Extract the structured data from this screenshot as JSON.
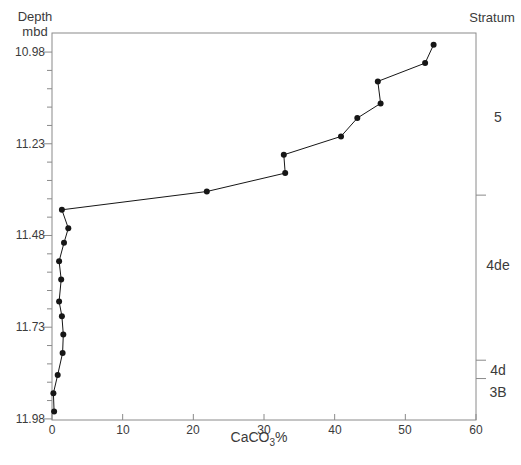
{
  "figure": {
    "y_axis_title_line1": "Depth",
    "y_axis_title_line2": "mbd",
    "right_axis_title": "Stratum",
    "x_axis_title_base": "CaCO",
    "x_axis_title_sub": "3",
    "x_axis_title_suffix": "%"
  },
  "chart_data": {
    "type": "line",
    "title": "",
    "xlabel": "CaCO3%",
    "ylabel": "Depth mbd",
    "right_label": "Stratum",
    "xlim": [
      0,
      60
    ],
    "x_ticks": [
      0,
      10,
      20,
      30,
      40,
      50,
      60
    ],
    "y_ticks_major": [
      10.98,
      11.23,
      11.48,
      11.73,
      11.98
    ],
    "y_minor_interval": 0.05,
    "depth_range_shown": [
      10.928,
      11.983
    ],
    "grid": false,
    "legend": "none",
    "series": [
      {
        "name": "CaCO3 percent vs depth",
        "marker": "filled-circle",
        "points": [
          {
            "x": 54.0,
            "depth": 10.96
          },
          {
            "x": 52.8,
            "depth": 11.01
          },
          {
            "x": 46.1,
            "depth": 11.06
          },
          {
            "x": 46.5,
            "depth": 11.12
          },
          {
            "x": 43.2,
            "depth": 11.16
          },
          {
            "x": 40.9,
            "depth": 11.21
          },
          {
            "x": 32.8,
            "depth": 11.26
          },
          {
            "x": 33.0,
            "depth": 11.31
          },
          {
            "x": 21.9,
            "depth": 11.36
          },
          {
            "x": 1.4,
            "depth": 11.41
          },
          {
            "x": 2.3,
            "depth": 11.46
          },
          {
            "x": 1.7,
            "depth": 11.5
          },
          {
            "x": 1.0,
            "depth": 11.55
          },
          {
            "x": 1.3,
            "depth": 11.6
          },
          {
            "x": 1.0,
            "depth": 11.66
          },
          {
            "x": 1.4,
            "depth": 11.7
          },
          {
            "x": 1.6,
            "depth": 11.75
          },
          {
            "x": 1.5,
            "depth": 11.8
          },
          {
            "x": 0.8,
            "depth": 11.86
          },
          {
            "x": 0.2,
            "depth": 11.91
          },
          {
            "x": 0.3,
            "depth": 11.96
          }
        ]
      }
    ],
    "strata": [
      {
        "label": "5",
        "from": 10.928,
        "to": 11.37,
        "label_depth": 11.157
      },
      {
        "label": "4de",
        "from": 11.37,
        "to": 11.82,
        "label_depth": 11.56
      },
      {
        "label": "4d",
        "from": 11.82,
        "to": 11.87,
        "label_depth": 11.847
      },
      {
        "label": "3B",
        "from": 11.87,
        "to": 11.983,
        "label_depth": 11.907
      }
    ],
    "colors": {
      "line": "#161616",
      "marker": "#161616",
      "axis": "#8a8a8a",
      "text": "#3b3b3b"
    }
  }
}
